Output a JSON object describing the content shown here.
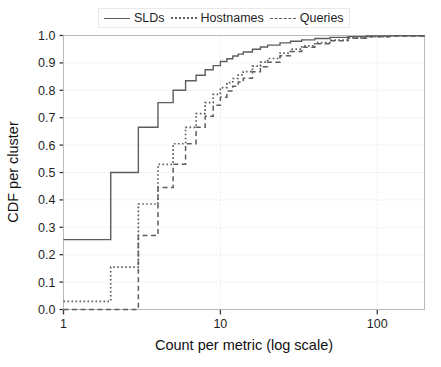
{
  "chart_data": {
    "type": "line",
    "title": "",
    "xlabel": "Count per metric (log scale)",
    "ylabel": "CDF per cluster",
    "xscale": "log",
    "xlim": [
      1,
      200
    ],
    "ylim": [
      0.0,
      1.0
    ],
    "grid": true,
    "legend_position": "top-center",
    "xticks": [
      1,
      10,
      100
    ],
    "xtick_labels": [
      "1",
      "10",
      "100"
    ],
    "yticks": [
      0.0,
      0.1,
      0.2,
      0.3,
      0.4,
      0.5,
      0.6,
      0.7,
      0.8,
      0.9,
      1.0
    ],
    "ytick_labels": [
      "0.0",
      "0.1",
      "0.2",
      "0.3",
      "0.4",
      "0.5",
      "0.6",
      "0.7",
      "0.8",
      "0.9",
      "1.0"
    ],
    "series": [
      {
        "name": "SLDs",
        "style": "solid",
        "color": "#5d5d5d",
        "x": [
          1,
          2,
          3,
          4,
          5,
          6,
          7,
          8,
          9,
          10,
          11,
          12,
          13,
          14,
          16,
          18,
          20,
          24,
          28,
          33,
          40,
          50,
          65,
          85,
          120,
          200
        ],
        "y": [
          0.255,
          0.5,
          0.665,
          0.755,
          0.8,
          0.835,
          0.855,
          0.875,
          0.89,
          0.905,
          0.915,
          0.925,
          0.932,
          0.94,
          0.95,
          0.958,
          0.965,
          0.973,
          0.979,
          0.984,
          0.989,
          0.993,
          0.996,
          0.998,
          0.999,
          1.0
        ]
      },
      {
        "name": "Hostnames",
        "style": "dotted",
        "color": "#5d5d5d",
        "x": [
          1,
          2,
          3,
          4,
          5,
          6,
          7,
          8,
          9,
          10,
          11,
          12,
          13,
          14,
          16,
          18,
          20,
          24,
          28,
          33,
          40,
          50,
          65,
          85,
          120,
          200
        ],
        "y": [
          0.03,
          0.155,
          0.385,
          0.53,
          0.605,
          0.665,
          0.715,
          0.755,
          0.785,
          0.81,
          0.828,
          0.843,
          0.856,
          0.868,
          0.888,
          0.903,
          0.916,
          0.936,
          0.95,
          0.962,
          0.974,
          0.983,
          0.991,
          0.996,
          0.999,
          1.0
        ]
      },
      {
        "name": "Queries",
        "style": "dashed",
        "color": "#5d5d5d",
        "x": [
          1,
          2,
          3,
          4,
          5,
          6,
          7,
          8,
          9,
          10,
          11,
          12,
          13,
          14,
          16,
          18,
          20,
          24,
          28,
          33,
          40,
          50,
          65,
          85,
          120,
          200
        ],
        "y": [
          0.0,
          0.0,
          0.27,
          0.445,
          0.53,
          0.605,
          0.665,
          0.705,
          0.745,
          0.775,
          0.797,
          0.815,
          0.83,
          0.844,
          0.868,
          0.886,
          0.902,
          0.926,
          0.942,
          0.957,
          0.97,
          0.981,
          0.99,
          0.995,
          0.998,
          1.0
        ]
      }
    ]
  },
  "legend": {
    "entries": [
      {
        "label": "SLDs",
        "style": "solid"
      },
      {
        "label": "Hostnames",
        "style": "dotted"
      },
      {
        "label": "Queries",
        "style": "dashed"
      }
    ]
  },
  "axes": {
    "x_title": "Count per metric (log scale)",
    "y_title": "CDF per cluster"
  },
  "colors": {
    "line": "#5d5d5d",
    "grid": "#e6e6e6",
    "frame": "#b9b9b9",
    "text": "#1f1f1f",
    "background": "#ffffff"
  }
}
